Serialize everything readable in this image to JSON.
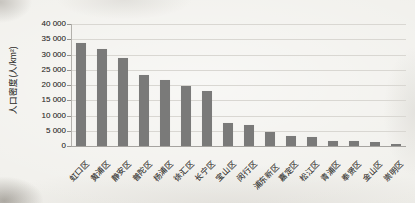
{
  "chart_data": {
    "type": "bar",
    "title": "",
    "xlabel": "",
    "ylabel": "人口密度(人/km²)",
    "categories": [
      "虹口区",
      "黄浦区",
      "静安区",
      "普陀区",
      "杨浦区",
      "徐汇区",
      "长宁区",
      "宝山区",
      "闵行区",
      "浦东新区",
      "嘉定区",
      "松江区",
      "青浦区",
      "奉贤区",
      "金山区",
      "崇明区"
    ],
    "values": [
      33900,
      31900,
      28800,
      23300,
      21500,
      19800,
      18100,
      7500,
      6800,
      4500,
      3400,
      2900,
      1800,
      1700,
      1400,
      600
    ],
    "ylim": [
      0,
      40000
    ],
    "ytick_interval": 5000,
    "ytick_labels": [
      "0",
      "5 000",
      "10 000",
      "15 000",
      "20 000",
      "25 000",
      "30 000",
      "35 000",
      "40 000"
    ],
    "grid": true,
    "legend_position": "none",
    "bar_color": "#7a7a79",
    "gridline_color": "#d9d7d2",
    "axis_color": "#a6a4a0",
    "text_color": "#3c3b39"
  }
}
